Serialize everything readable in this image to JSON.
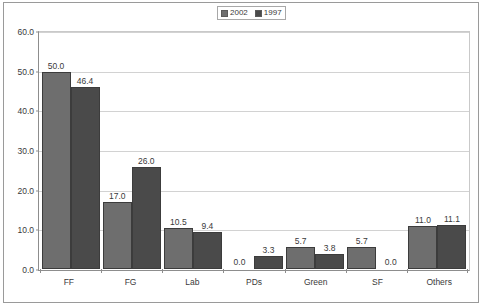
{
  "chart_data": {
    "type": "bar",
    "title": "",
    "subtitle": "",
    "xlabel": "",
    "ylabel": "",
    "categories": [
      "FF",
      "FG",
      "Lab",
      "PDs",
      "Green",
      "SF",
      "Others"
    ],
    "series": [
      {
        "name": "2002",
        "color": "#6e6e6e",
        "values": [
          50.0,
          17.0,
          10.5,
          0.0,
          5.7,
          5.7,
          11.0
        ],
        "labels": [
          "50.0",
          "17.0",
          "10.5",
          "0.0",
          "5.7",
          "5.7",
          "11.0"
        ]
      },
      {
        "name": "1997",
        "color": "#4a4a4a",
        "values": [
          46.4,
          26.0,
          9.4,
          3.3,
          3.8,
          0.0,
          11.1
        ],
        "labels": [
          "46.4",
          "26.0",
          "9.4",
          "3.3",
          "3.8",
          "0.0",
          "11.1"
        ]
      }
    ],
    "ylim": [
      0.0,
      60.0
    ],
    "ytick_values": [
      60.0,
      50.0,
      40.0,
      30.0,
      20.0,
      10.0,
      0.0
    ],
    "ytick_labels": [
      "60.0",
      "50.0",
      "40.0",
      "30.0",
      "20.0",
      "10.0",
      "0.0"
    ],
    "grid": true,
    "grid_axis": "y",
    "legend_position": "top-center",
    "data_labels": true,
    "annotations": []
  },
  "legend": {
    "entries": [
      {
        "label": "2002",
        "color": "#6e6e6e"
      },
      {
        "label": "1997",
        "color": "#4a4a4a"
      }
    ]
  }
}
